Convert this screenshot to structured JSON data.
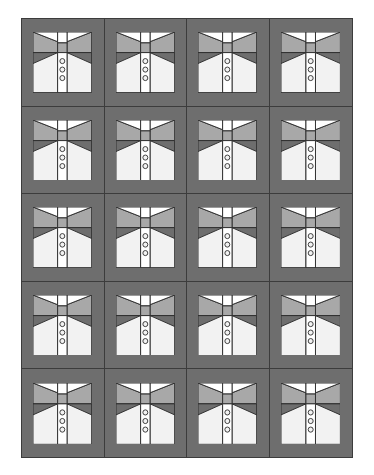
{
  "artwork": {
    "subject": "shirt-quilt-grid",
    "canvas_width": 374,
    "canvas_height": 475,
    "margin_color": "#ffffff"
  },
  "panel": {
    "x": 21,
    "y": 18,
    "width": 332,
    "height": 440,
    "background_color": "#6e6e6e",
    "border_color": "#3c3c3c",
    "border_width": 1
  },
  "grid": {
    "columns": 4,
    "rows": 5,
    "total_blocks": 20,
    "divider_color": "#3c3c3c",
    "divider_width": 1
  },
  "block": {
    "name": "shirt-block",
    "buttons_per_block": 3,
    "colors": {
      "sashing": "#6e6e6e",
      "shoulder": "#a8a8a8",
      "body": "#f2f2f2",
      "placket": "#ffffff",
      "collar": "#ffffff",
      "outline": "#2e2e2e",
      "button_fill": "#f2f2f2",
      "button_stroke": "#2e2e2e"
    }
  },
  "chart_data": {
    "type": "table",
    "columns": [
      "Row",
      "Col 1",
      "Col 2",
      "Col 3",
      "Col 4"
    ],
    "rows": [
      [
        "Row 1",
        "shirt",
        "shirt",
        "shirt",
        "shirt"
      ],
      [
        "Row 2",
        "shirt",
        "shirt",
        "shirt",
        "shirt"
      ],
      [
        "Row 3",
        "shirt",
        "shirt",
        "shirt",
        "shirt"
      ],
      [
        "Row 4",
        "shirt",
        "shirt",
        "shirt",
        "shirt"
      ],
      [
        "Row 5",
        "shirt",
        "shirt",
        "shirt",
        "shirt"
      ]
    ]
  }
}
